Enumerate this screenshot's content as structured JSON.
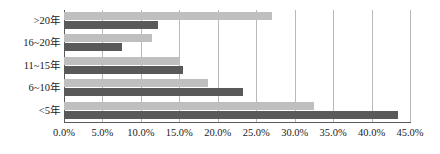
{
  "chart_data": {
    "type": "bar",
    "orientation": "horizontal",
    "title": "",
    "subtitle": "",
    "xlabel": "",
    "ylabel": "",
    "categories": [
      ">20年",
      "16~20年",
      "11~15年",
      "6~10年",
      "<5年"
    ],
    "series": [
      {
        "name": "series-1",
        "color": "#bfbfbf",
        "values": [
          27.0,
          11.4,
          15.1,
          18.7,
          32.5
        ]
      },
      {
        "name": "series-2",
        "color": "#595959",
        "values": [
          12.2,
          7.5,
          15.5,
          23.3,
          43.4
        ]
      }
    ],
    "xlim": [
      0.0,
      45.0
    ],
    "xticks": [
      0.0,
      5.0,
      10.0,
      15.0,
      20.0,
      25.0,
      30.0,
      35.0,
      40.0,
      45.0
    ],
    "xtick_labels": [
      "0.0%",
      "5.0%",
      "10.0%",
      "15.0%",
      "20.0%",
      "25.0%",
      "30.0%",
      "35.0%",
      "40.0%",
      "45.0%"
    ],
    "value_format": "percent",
    "grid": {
      "vertical": true,
      "horizontal": false,
      "color": "#b9b9b9"
    },
    "legend": {
      "visible": false,
      "position": "none"
    },
    "axis_line_color": "#5a5a5a",
    "background": "#ffffff"
  }
}
